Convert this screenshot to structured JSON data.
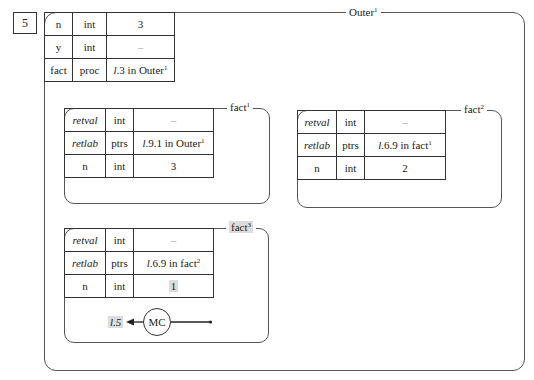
{
  "step_number": "5",
  "outer_frame": {
    "label": "Outer",
    "label_sup": "1",
    "table": [
      {
        "name": "n",
        "type": "int",
        "value": "3"
      },
      {
        "name": "y",
        "type": "int",
        "value": "–"
      },
      {
        "name": "fact",
        "type": "proc",
        "value_prefix": "l",
        "value": ".3 in Outer",
        "value_sup": "1"
      }
    ]
  },
  "frames": [
    {
      "label": "fact",
      "label_sup": "1",
      "table": [
        {
          "name": "retval",
          "type": "int",
          "value": "–"
        },
        {
          "name": "retlab",
          "type": "ptrs",
          "value_prefix": "l",
          "value": ".9.1 in Outer",
          "value_sup": "1"
        },
        {
          "name": "n",
          "type": "int",
          "value": "3"
        }
      ]
    },
    {
      "label": "fact",
      "label_sup": "2",
      "table": [
        {
          "name": "retval",
          "type": "int",
          "value": "–"
        },
        {
          "name": "retlab",
          "type": "ptrs",
          "value_prefix": "l",
          "value": ".6.9 in fact",
          "value_sup": "1"
        },
        {
          "name": "n",
          "type": "int",
          "value": "2"
        }
      ]
    },
    {
      "label": "fact",
      "label_sup": "3",
      "highlighted_label": true,
      "table": [
        {
          "name": "retval",
          "type": "int",
          "value": "–"
        },
        {
          "name": "retlab",
          "type": "ptrs",
          "value_prefix": "l",
          "value": ".6.9 in fact",
          "value_sup": "2"
        },
        {
          "name": "n",
          "type": "int",
          "value": "1",
          "highlighted": true
        }
      ],
      "control": {
        "return_label": "l.5",
        "circle_label": "MC"
      }
    }
  ],
  "colors": {
    "line": "#333333",
    "highlight": "#dcdcdc",
    "background": "#ffffff"
  }
}
